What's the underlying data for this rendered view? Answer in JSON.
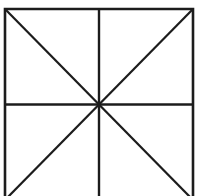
{
  "figure": {
    "background_color": "#ffffff",
    "line_color": "#1c1c1c",
    "fill_color": "#ffffff",
    "canvas": {
      "width": 198,
      "height": 196
    },
    "geometry": {
      "square": {
        "left": 5,
        "top": 9,
        "right": 193,
        "bottom": 200,
        "width": 188,
        "height": 191,
        "bottom_edge_visible": false
      },
      "center": {
        "x": 99,
        "y": 104.5
      },
      "stroke_width_border": 2.6,
      "stroke_width_inner": 2.4,
      "stroke_width_diagonal": 2.2
    },
    "elements": [
      {
        "name": "square-border",
        "type": "polyline",
        "points": "5,200 5,9 193,9 193,200"
      },
      {
        "name": "vertical-midline",
        "type": "line",
        "x1": 99,
        "y1": 9,
        "x2": 99,
        "y2": 200
      },
      {
        "name": "horizontal-midline",
        "type": "line",
        "x1": 5,
        "y1": 104.5,
        "x2": 193,
        "y2": 104.5
      },
      {
        "name": "diagonal-top-left-to-bottom-right",
        "type": "line",
        "x1": 5,
        "y1": 9,
        "x2": 193,
        "y2": 200
      },
      {
        "name": "diagonal-top-right-to-bottom-left",
        "type": "line",
        "x1": 193,
        "y1": 9,
        "x2": 5,
        "y2": 200
      }
    ],
    "region_count": 8
  }
}
